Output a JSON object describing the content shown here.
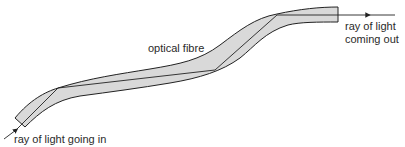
{
  "diagram": {
    "labels": {
      "fibre": "optical fibre",
      "ray_out_line1": "ray of light",
      "ray_out_line2": "coming out",
      "ray_in": "ray of light going in"
    },
    "colors": {
      "fibre_fill": "#d9d9d9",
      "outline": "#222222",
      "text": "#2a2a2a"
    }
  }
}
